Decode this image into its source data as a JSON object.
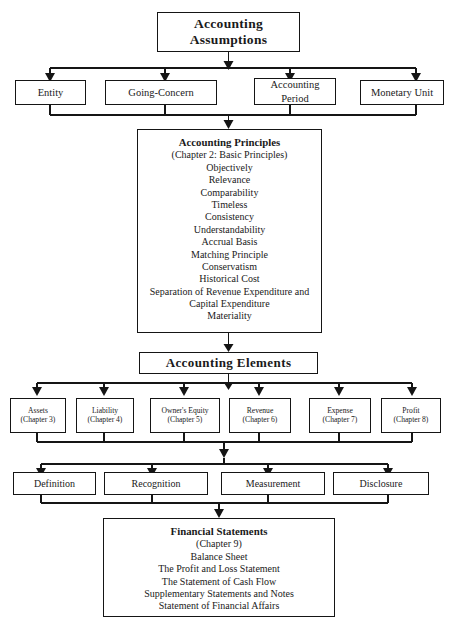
{
  "diagram": {
    "line_color": "#151515",
    "background": "#ffffff",
    "root": {
      "lines": [
        "Accounting",
        "Assumptions"
      ]
    },
    "assumptions": [
      {
        "lines": [
          "Entity"
        ]
      },
      {
        "lines": [
          "Going-Concern"
        ]
      },
      {
        "lines": [
          "Accounting",
          "Period"
        ]
      },
      {
        "lines": [
          "Monetary Unit"
        ]
      }
    ],
    "principles": {
      "heading": "Accounting Principles",
      "subheading": "(Chapter 2: Basic Principles)",
      "items": [
        "Objectively",
        "Relevance",
        "Comparability",
        "Timeless",
        "Consistency",
        "Understandability",
        "Accrual Basis",
        "Matching Principle",
        "Conservatism",
        "Historical Cost",
        "Separation of Revenue Expenditure and",
        "Capital Expenditure",
        "Materiality"
      ]
    },
    "elements_header": {
      "label": "Accounting Elements"
    },
    "elements": [
      {
        "name": "Assets",
        "chapter": "(Chapter 3)"
      },
      {
        "name": "Liability",
        "chapter": "(Chapter 4)"
      },
      {
        "name": "Owner's Equity",
        "chapter": "(Chapter 5)"
      },
      {
        "name": "Revenue",
        "chapter": "(Chapter 6)"
      },
      {
        "name": "Expense",
        "chapter": "(Chapter 7)"
      },
      {
        "name": "Profit",
        "chapter": "(Chapter 8)"
      }
    ],
    "aspects": [
      {
        "label": "Definition"
      },
      {
        "label": "Recognition"
      },
      {
        "label": "Measurement"
      },
      {
        "label": "Disclosure"
      }
    ],
    "statements": {
      "heading": "Financial Statements",
      "subheading": "(Chapter 9)",
      "items": [
        "Balance Sheet",
        "The Profit and Loss Statement",
        "The Statement of Cash Flow",
        "Supplementary Statements and Notes",
        "Statement of Financial Affairs"
      ]
    }
  }
}
